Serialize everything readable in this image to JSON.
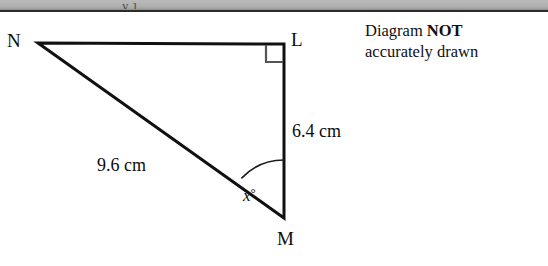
{
  "page": {
    "background_color": "#ffffff",
    "ink_color": "#0d0d0d",
    "scan_strip": {
      "color": "#b2b2b2",
      "edge_color": "#2b2b2b",
      "clipped_text": "y  1"
    }
  },
  "diagram": {
    "type": "right-triangle",
    "vertices": [
      {
        "name": "N",
        "label": "N",
        "x": 38,
        "y": 31
      },
      {
        "name": "L",
        "label": "L",
        "x": 284,
        "y": 32
      },
      {
        "name": "M",
        "label": "M",
        "x": 284,
        "y": 206
      }
    ],
    "right_angle_at": "L",
    "right_angle_marker": {
      "size": 18,
      "color": "#4a4a4a"
    },
    "sides": [
      {
        "name": "NL",
        "from": "N",
        "to": "L",
        "label": "",
        "stroke": 3
      },
      {
        "name": "LM",
        "from": "L",
        "to": "M",
        "label": "6.4 cm",
        "value": 6.4,
        "unit": "cm",
        "stroke": 3
      },
      {
        "name": "NM",
        "from": "N",
        "to": "M",
        "label": "9.6 cm",
        "value": 9.6,
        "unit": "cm",
        "stroke": 3
      }
    ],
    "angle": {
      "at": "M",
      "between": [
        "MN",
        "ML"
      ],
      "label": "x",
      "degree_symbol": "°",
      "arc_radius": 58,
      "arc_color": "#1a1a1a"
    },
    "labels": {
      "n": "N",
      "l": "L",
      "m": "M",
      "side_nm": "9.6 cm",
      "side_lm": "6.4 cm",
      "angle_x": "x",
      "angle_degree": "°"
    }
  },
  "note": {
    "line1_prefix": "Diagram ",
    "line1_emphasis": "NOT",
    "line2": "accurately drawn"
  }
}
